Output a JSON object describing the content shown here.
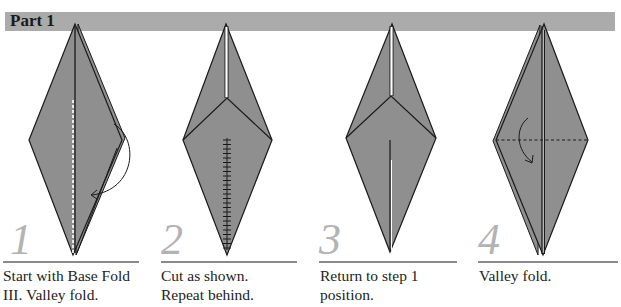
{
  "header": {
    "title": "Part 1",
    "bar_color": "#ababab"
  },
  "colors": {
    "paper": "#8f8f8f",
    "outline": "#1a1a1a",
    "step_number": "#b3b3b3"
  },
  "steps": [
    {
      "number": "1",
      "caption_line1": "Start with Base Fold",
      "caption_line2": "III. Valley fold."
    },
    {
      "number": "2",
      "caption_line1": "Cut as shown.",
      "caption_line2": "Repeat behind."
    },
    {
      "number": "3",
      "caption_line1": "Return to step 1",
      "caption_line2": "position."
    },
    {
      "number": "4",
      "caption_line1": "Valley fold.",
      "caption_line2": ""
    }
  ]
}
